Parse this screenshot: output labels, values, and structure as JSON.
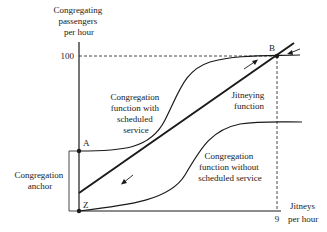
{
  "figure": {
    "y_axis_label": [
      "Congregating",
      "passengers",
      "per hour"
    ],
    "x_axis_label": [
      "Jitneys",
      "per hour"
    ],
    "y_tick": "100",
    "x_tick": "9",
    "points": {
      "A": "A",
      "B": "B",
      "Z": "Z"
    },
    "curves": {
      "with_service": [
        "Congregation",
        "function with",
        "scheduled",
        "service"
      ],
      "jitneying": [
        "Jitneying",
        "function"
      ],
      "without_service": [
        "Congregation",
        "function without",
        "scheduled service"
      ]
    },
    "anchor_label": [
      "Congregation",
      "anchor"
    ],
    "colors": {
      "ink": "#1a1a1a",
      "background": "#ffffff"
    }
  }
}
